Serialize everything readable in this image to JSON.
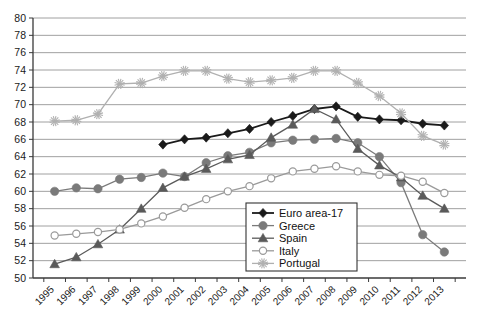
{
  "chart_data": {
    "type": "line",
    "title": "",
    "subtitle": "",
    "xlabel": "",
    "ylabel": "",
    "grid": true,
    "legend_position": "bottom-center",
    "ylim": [
      50,
      80
    ],
    "ytick_step": 2,
    "yticks": [
      "50",
      "52",
      "54",
      "56",
      "58",
      "60",
      "62",
      "64",
      "66",
      "68",
      "70",
      "72",
      "74",
      "76",
      "78",
      "80"
    ],
    "x": [
      "1995",
      "1996",
      "1997",
      "1998",
      "1999",
      "2000",
      "2001",
      "2002",
      "2003",
      "2004",
      "2005",
      "2006",
      "2007",
      "2008",
      "2009",
      "2010",
      "2011",
      "2012",
      "2013"
    ],
    "categories": [
      "1995",
      "1996",
      "1997",
      "1998",
      "1999",
      "2000",
      "2001",
      "2002",
      "2003",
      "2004",
      "2005",
      "2006",
      "2007",
      "2008",
      "2009",
      "2010",
      "2011",
      "2012",
      "2013"
    ],
    "series": [
      {
        "name": "Euro area-17",
        "color": "#1a1a1a",
        "marker": "diamond",
        "values": [
          null,
          null,
          null,
          null,
          null,
          65.4,
          66.0,
          66.2,
          66.7,
          67.2,
          68.0,
          68.7,
          69.5,
          69.8,
          68.6,
          68.3,
          68.2,
          67.8,
          67.6
        ]
      },
      {
        "name": "Greece",
        "color": "#7a7a7a",
        "marker": "circle-filled",
        "values": [
          60.0,
          60.4,
          60.3,
          61.4,
          61.6,
          62.1,
          61.7,
          63.3,
          64.1,
          64.5,
          65.6,
          65.9,
          66.0,
          66.1,
          65.6,
          64.0,
          61.0,
          55.0,
          53.0
        ]
      },
      {
        "name": "Spain",
        "color": "#5a5a5a",
        "marker": "triangle",
        "values": [
          51.6,
          52.4,
          53.9,
          55.6,
          58.0,
          60.4,
          61.7,
          62.6,
          63.7,
          64.2,
          66.2,
          67.7,
          69.5,
          68.3,
          64.9,
          63.0,
          61.6,
          59.5,
          58.0
        ]
      },
      {
        "name": "Italy",
        "color": "#9a9a9a",
        "marker": "circle-open",
        "values": [
          54.9,
          55.1,
          55.3,
          55.6,
          56.3,
          57.1,
          58.1,
          59.1,
          60.0,
          60.6,
          61.5,
          62.3,
          62.6,
          62.9,
          62.3,
          61.9,
          61.8,
          61.1,
          59.8
        ]
      },
      {
        "name": "Portugal",
        "color": "#b0b0b0",
        "marker": "asterisk",
        "values": [
          68.1,
          68.2,
          68.9,
          72.4,
          72.5,
          73.3,
          73.9,
          73.9,
          73.0,
          72.6,
          72.8,
          73.1,
          73.9,
          73.9,
          72.5,
          71.0,
          69.0,
          66.4,
          65.4
        ]
      }
    ],
    "legend": [
      {
        "label": "Euro area-17",
        "color": "#1a1a1a",
        "marker": "diamond"
      },
      {
        "label": "Greece",
        "color": "#7a7a7a",
        "marker": "circle-filled"
      },
      {
        "label": "Spain",
        "color": "#5a5a5a",
        "marker": "triangle"
      },
      {
        "label": "Italy",
        "color": "#9a9a9a",
        "marker": "circle-open"
      },
      {
        "label": "Portugal",
        "color": "#b0b0b0",
        "marker": "asterisk"
      }
    ],
    "colors": {
      "axis": "#3a3a3a",
      "grid": "#888888",
      "background": "#ffffff",
      "legend_border": "#333333"
    }
  }
}
